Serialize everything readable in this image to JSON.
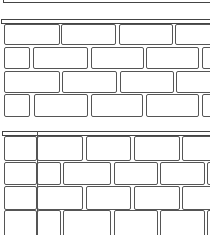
{
  "scene": {
    "description": "Two brick wall line drawings",
    "stroke_color": "#555555",
    "background": "#ffffff"
  },
  "top_frame": {
    "x": 3,
    "y": -2,
    "w": 210,
    "h": 5
  },
  "walls": [
    {
      "name": "wall-top",
      "cap": {
        "x": 1,
        "y": 19,
        "w": 212,
        "h": 5
      },
      "left_x": 4,
      "bricks": [
        [
          4,
          24,
          56,
          21
        ],
        [
          61,
          24,
          55,
          21
        ],
        [
          119,
          24,
          54,
          21
        ],
        [
          175,
          24,
          40,
          21
        ],
        [
          4,
          47,
          26,
          22
        ],
        [
          33,
          47,
          55,
          22
        ],
        [
          91,
          47,
          53,
          22
        ],
        [
          146,
          47,
          53,
          22
        ],
        [
          202,
          47,
          12,
          22
        ],
        [
          4,
          71,
          56,
          22
        ],
        [
          62,
          71,
          55,
          22
        ],
        [
          120,
          71,
          54,
          22
        ],
        [
          176,
          71,
          40,
          22
        ],
        [
          4,
          94,
          26,
          23
        ],
        [
          34,
          94,
          54,
          23
        ],
        [
          91,
          94,
          52,
          23
        ],
        [
          146,
          94,
          53,
          23
        ],
        [
          202,
          94,
          12,
          23
        ]
      ]
    },
    {
      "name": "wall-bottom",
      "cap": {
        "x": 2,
        "y": 131,
        "w": 212,
        "h": 5
      },
      "left_x": 4,
      "divider_x": 37,
      "bricks": [
        [
          4,
          136,
          33,
          25
        ],
        [
          37,
          136,
          46,
          25
        ],
        [
          86,
          136,
          45,
          25
        ],
        [
          134,
          136,
          46,
          25
        ],
        [
          182,
          136,
          32,
          25
        ],
        [
          4,
          162,
          33,
          23
        ],
        [
          37,
          162,
          24,
          23
        ],
        [
          63,
          162,
          48,
          23
        ],
        [
          114,
          162,
          44,
          23
        ],
        [
          160,
          162,
          45,
          23
        ],
        [
          207,
          162,
          8,
          23
        ],
        [
          4,
          186,
          33,
          24
        ],
        [
          37,
          186,
          46,
          24
        ],
        [
          86,
          186,
          45,
          24
        ],
        [
          134,
          186,
          46,
          24
        ],
        [
          182,
          186,
          32,
          24
        ],
        [
          4,
          210,
          33,
          30
        ],
        [
          37,
          210,
          24,
          30
        ],
        [
          63,
          210,
          48,
          30
        ],
        [
          114,
          210,
          44,
          30
        ],
        [
          160,
          210,
          45,
          30
        ],
        [
          207,
          210,
          8,
          30
        ]
      ]
    }
  ]
}
